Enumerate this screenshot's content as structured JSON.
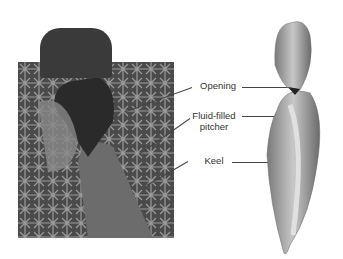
{
  "figure": {
    "photo_alt": "Pitcher plant photograph among ferns",
    "illustration_alt": "Pitcher plant illustration",
    "labels": [
      {
        "id": "opening",
        "text": "Opening"
      },
      {
        "id": "fluid",
        "line1": "Fluid-filled",
        "line2": "pitcher"
      },
      {
        "id": "keel",
        "text": "Keel"
      }
    ]
  }
}
